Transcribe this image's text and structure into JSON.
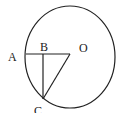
{
  "diagram": {
    "type": "geometry",
    "labels": {
      "A": "A",
      "B": "B",
      "O": "O",
      "C": "C"
    },
    "shapes": [
      "circle centered at O",
      "segment AO",
      "segment BC perpendicular to AO",
      "segment OC"
    ],
    "colors": {
      "stroke": "#222222",
      "background": "#ffffff"
    }
  }
}
